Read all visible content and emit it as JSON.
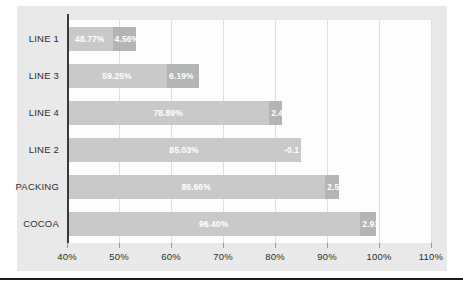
{
  "chart_data": {
    "type": "bar",
    "orientation": "horizontal",
    "stacked": true,
    "title": "",
    "xlabel": "",
    "ylabel": "",
    "xlim": [
      40,
      110
    ],
    "xticks": [
      40,
      50,
      60,
      70,
      80,
      90,
      100,
      110
    ],
    "xtick_labels": [
      "40%",
      "50%",
      "60%",
      "70%",
      "80%",
      "90%",
      "100%",
      "110%"
    ],
    "grid": true,
    "legend": "none",
    "categories": [
      "LINE 1",
      "LINE 3",
      "LINE 4",
      "LINE 2",
      "PACKING",
      "COCOA"
    ],
    "series": [
      {
        "name": "primary",
        "color": "#c9c9c9",
        "values": [
          48.77,
          59.25,
          78.89,
          85.03,
          89.66,
          96.4
        ],
        "labels": [
          "48.77%",
          "59.25%",
          "78.89%",
          "85.03%",
          "89.66%",
          "96.40%"
        ]
      },
      {
        "name": "delta",
        "color": "#b4b4b4",
        "values": [
          4.56,
          6.19,
          2.44,
          -0.1,
          2.58,
          2.93
        ],
        "labels": [
          "4.56%",
          "6.19%",
          "2.44",
          "-0.1",
          "2.58",
          "2.93%"
        ]
      }
    ],
    "bars": [
      {
        "category": "LINE 1",
        "primary_value": 48.77,
        "primary_label": "48.77%",
        "delta_value": 4.56,
        "delta_label": "4.56%"
      },
      {
        "category": "LINE 3",
        "primary_value": 59.25,
        "primary_label": "59.25%",
        "delta_value": 6.19,
        "delta_label": "6.19%"
      },
      {
        "category": "LINE 4",
        "primary_value": 78.89,
        "primary_label": "78.89%",
        "delta_value": 2.44,
        "delta_label": "2.44"
      },
      {
        "category": "LINE 2",
        "primary_value": 85.03,
        "primary_label": "85.03%",
        "delta_value": -0.1,
        "delta_label": "-0.1"
      },
      {
        "category": "PACKING",
        "primary_value": 89.66,
        "primary_label": "89.66%",
        "delta_value": 2.58,
        "delta_label": "2.58"
      },
      {
        "category": "COCOA",
        "primary_value": 96.4,
        "primary_label": "96.40%",
        "delta_value": 2.93,
        "delta_label": "2.93%"
      }
    ]
  },
  "colors": {
    "series_primary": "#c9c9c9",
    "series_delta": "#b4b4b4",
    "chart_background": "#e9e9e9",
    "plot_background": "#fdfdfd",
    "axis_line": "#3a3a3a",
    "gridline": "#dedede",
    "label_text": "#2e2e2e",
    "bar_label_text": "#ffffff",
    "bottom_rule": "#1c1c1c"
  }
}
